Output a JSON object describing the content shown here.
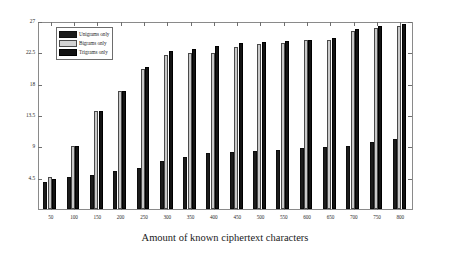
{
  "chart_data": {
    "type": "bar",
    "title": "",
    "xlabel": "Amount of known ciphertext characters",
    "ylabel": "",
    "grid": false,
    "legend_position": "top-left",
    "ylim": [
      0,
      27
    ],
    "yticks": [
      "4.5",
      "9",
      "13.5",
      "18",
      "22.5",
      "27"
    ],
    "ytick_values": [
      4.5,
      9,
      13.5,
      18,
      22.5,
      27
    ],
    "categories": [
      "50",
      "100",
      "150",
      "200",
      "250",
      "300",
      "350",
      "400",
      "450",
      "500",
      "550",
      "600",
      "650",
      "700",
      "750",
      "800"
    ],
    "series": [
      {
        "name": "Unigrams only",
        "color": "#1c1c1c",
        "values": [
          3.9,
          4.6,
          5.0,
          5.5,
          6.0,
          7.0,
          7.5,
          8.1,
          8.3,
          8.4,
          8.6,
          8.9,
          9.0,
          9.2,
          9.8,
          10.1
        ]
      },
      {
        "name": "Bigrams only",
        "color": "#c9c9c9",
        "values": [
          4.6,
          9.1,
          14.3,
          17.2,
          20.3,
          22.3,
          22.6,
          22.7,
          23.5,
          23.9,
          24.1,
          24.5,
          24.5,
          25.8,
          26.3,
          26.6
        ]
      },
      {
        "name": "Trigrams only",
        "color": "#131313",
        "values": [
          4.4,
          9.2,
          14.2,
          17.2,
          20.6,
          23.0,
          23.3,
          23.6,
          24.1,
          24.3,
          24.4,
          24.6,
          24.8,
          26.1,
          26.5,
          26.9
        ]
      }
    ]
  },
  "legend": {
    "items": [
      {
        "label": "Unigrams only"
      },
      {
        "label": "Bigrams only"
      },
      {
        "label": "Trigrams only"
      }
    ]
  }
}
